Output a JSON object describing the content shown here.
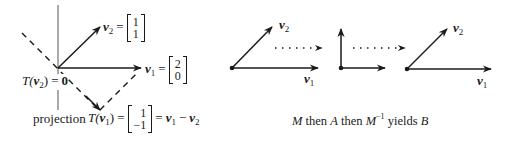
{
  "left_diagram": {
    "v2_label": {
      "name": "v",
      "sub": "2",
      "eq": "=",
      "matrix": [
        "1",
        "1"
      ]
    },
    "v1_label": {
      "name": "v",
      "sub": "1",
      "eq": "=",
      "matrix": [
        "2",
        "0"
      ]
    },
    "Tv2_label": {
      "prefix": "T(",
      "name": "v",
      "sub": "2",
      "suffix": ")",
      "eq": "=",
      "value": "0"
    },
    "projection_label": "projection",
    "Tv1_label": {
      "prefix": "T(",
      "name": "v",
      "sub": "1",
      "suffix": ")",
      "eq": "=",
      "matrix": [
        "1",
        "−1"
      ],
      "eq2": "=",
      "rhs": {
        "a": "v",
        "a_sub": "1",
        "op": "−",
        "b": "v",
        "b_sub": "2"
      }
    }
  },
  "right_diagram": {
    "panels": [
      {
        "v1": {
          "name": "v",
          "sub": "1"
        },
        "v2": {
          "name": "v",
          "sub": "2"
        }
      },
      {},
      {
        "v1": {
          "name": "v",
          "sub": "1"
        },
        "v2": {
          "name": "v",
          "sub": "2"
        }
      }
    ],
    "caption": {
      "M": "M",
      "then1": " then ",
      "A": "A",
      "then2": " then ",
      "Minv": "M",
      "Minv_sup": "−1",
      "yields": " yields ",
      "B": "B"
    }
  },
  "colors": {
    "ink": "#1a1a1a",
    "axis": "#555555",
    "background": "#ffffff"
  }
}
